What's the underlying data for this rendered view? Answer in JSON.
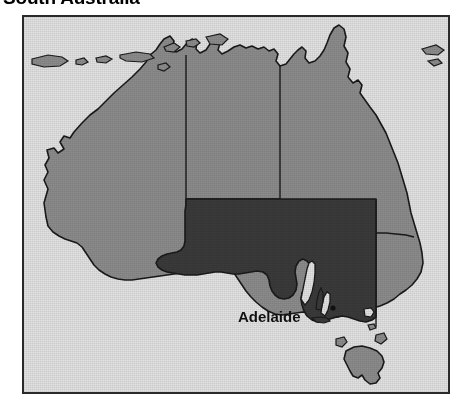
{
  "title": "South Australia",
  "map": {
    "frame": {
      "border_color": "#2a2a2a",
      "x": 22,
      "y": 15,
      "width": 428,
      "height": 379
    },
    "colors": {
      "ocean": "#e2e2e2",
      "land_other_states": "#8c8c8c",
      "highlight_south_australia": "#3a3a3a",
      "coastline": "#1a1a1a",
      "state_border": "#1a1a1a",
      "label_text": "#111111"
    },
    "highlighted_region": "South Australia",
    "city_labels": [
      {
        "name": "Adelaide",
        "x": 236,
        "y": 313
      }
    ],
    "regions": [
      {
        "name": "Western Australia",
        "highlighted": false
      },
      {
        "name": "Northern Territory",
        "highlighted": false
      },
      {
        "name": "Queensland",
        "highlighted": false
      },
      {
        "name": "South Australia",
        "highlighted": true
      },
      {
        "name": "New South Wales",
        "highlighted": false
      },
      {
        "name": "Victoria",
        "highlighted": false
      },
      {
        "name": "Tasmania",
        "highlighted": false
      }
    ]
  }
}
